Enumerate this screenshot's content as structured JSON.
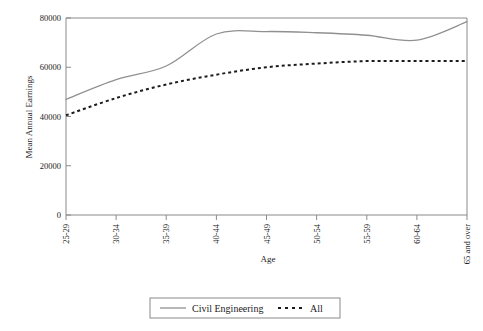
{
  "chart_data": {
    "type": "line",
    "title": "",
    "xlabel": "Age",
    "ylabel": "Mean Annual Earnings",
    "categories": [
      "25-29",
      "30-34",
      "35-39",
      "40-44",
      "45-49",
      "50-54",
      "55-59",
      "60-64",
      "65 and over"
    ],
    "ylim": [
      0,
      80000
    ],
    "yticks": [
      0,
      20000,
      40000,
      60000,
      80000
    ],
    "ytick_labels": [
      "0",
      "20000",
      "40000",
      "60000",
      "80000"
    ],
    "grid": false,
    "legend_position": "bottom",
    "series": [
      {
        "name": "Civil Engineering",
        "style": "solid",
        "color": "#909090",
        "values": [
          47000,
          55000,
          60500,
          73500,
          74500,
          74000,
          73000,
          71000,
          78500
        ]
      },
      {
        "name": "All",
        "style": "dotted",
        "color": "#1c1c1c",
        "values": [
          40500,
          47500,
          53000,
          57000,
          60000,
          61500,
          62500,
          62500,
          62500
        ]
      }
    ]
  },
  "legend": {
    "entries": [
      {
        "label": "Civil Engineering",
        "marker": "solid-line-swatch"
      },
      {
        "label": "All",
        "marker": "dotted-line-swatch"
      }
    ]
  },
  "axes": {
    "x_title": "Age",
    "y_title": "Mean Annual Earnings"
  }
}
